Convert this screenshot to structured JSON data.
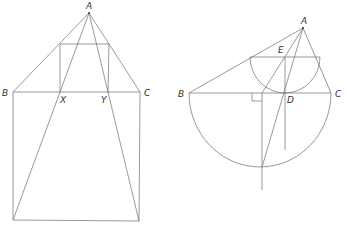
{
  "figure_left": {
    "labels": {
      "A": "A",
      "B": "B",
      "C": "C",
      "X": "X",
      "Y": "Y"
    }
  },
  "figure_right": {
    "labels": {
      "A": "A",
      "B": "B",
      "C": "C",
      "D": "D",
      "E": "E"
    }
  },
  "colors": {
    "stroke": "#6e6e6e",
    "text": "#333333",
    "background": "#ffffff"
  }
}
